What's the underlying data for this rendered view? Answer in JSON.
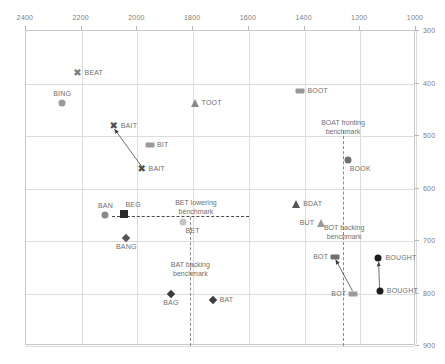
{
  "chart_data": {
    "type": "scatter",
    "title": "",
    "xlabel": "",
    "ylabel": "",
    "xlim": [
      2400,
      1000
    ],
    "ylim": [
      300,
      900
    ],
    "x_axis_position": "top",
    "y_axis_position": "right",
    "x_ticks": [
      2400,
      2200,
      2000,
      1800,
      1600,
      1400,
      1200,
      1000
    ],
    "y_ticks": [
      300,
      400,
      500,
      600,
      700,
      800,
      900
    ],
    "grid": true,
    "legend": "none",
    "points": [
      {
        "label": "BEAT",
        "x": 2215,
        "y": 380,
        "marker": "x",
        "color": "#7a7a7a",
        "label_pos": "right"
      },
      {
        "label": "BING",
        "x": 2270,
        "y": 438,
        "marker": "circle",
        "color": "#9a9a9a",
        "label_pos": "above"
      },
      {
        "label": "BAIT",
        "x": 2085,
        "y": 480,
        "marker": "x",
        "color": "#4d4d4d",
        "label_pos": "right"
      },
      {
        "label": "BAIT",
        "x": 1985,
        "y": 563,
        "marker": "x",
        "color": "#4d4d4d",
        "label_pos": "right"
      },
      {
        "label": "BIT",
        "x": 1955,
        "y": 518,
        "marker": "rect",
        "color": "#9a9a9a",
        "label_pos": "right"
      },
      {
        "label": "TOOT",
        "x": 1795,
        "y": 438,
        "marker": "triangle",
        "color": "#8a8a8a",
        "label_pos": "right"
      },
      {
        "label": "BOOT",
        "x": 1415,
        "y": 415,
        "marker": "rect",
        "color": "#9a9a9a",
        "label_pos": "right"
      },
      {
        "label": "BOOK",
        "x": 1245,
        "y": 545,
        "marker": "circle",
        "color": "#6f6f6f",
        "label_pos": "below-right"
      },
      {
        "label": "BAN",
        "x": 2115,
        "y": 650,
        "marker": "circle",
        "color": "#8a8a8a",
        "label_pos": "above"
      },
      {
        "label": "BEG",
        "x": 2050,
        "y": 648,
        "marker": "square",
        "color": "#2b2b2b",
        "label_pos": "above-right"
      },
      {
        "label": "BANG",
        "x": 2040,
        "y": 695,
        "marker": "diamond",
        "color": "#555555",
        "label_pos": "below"
      },
      {
        "label": "BET",
        "x": 1835,
        "y": 663,
        "marker": "circle",
        "color": "#c4c4c4",
        "label_pos": "below-right"
      },
      {
        "label": "BDAT",
        "x": 1430,
        "y": 630,
        "marker": "triangle",
        "color": "#555555",
        "label_pos": "right"
      },
      {
        "label": "BUT",
        "x": 1340,
        "y": 665,
        "marker": "triangle",
        "color": "#9a9a9a",
        "label_pos": "left"
      },
      {
        "label": "BOT",
        "x": 1290,
        "y": 730,
        "marker": "rect",
        "color": "#6f6f6f",
        "label_pos": "left"
      },
      {
        "label": "BOT",
        "x": 1225,
        "y": 800,
        "marker": "rect",
        "color": "#9a9a9a",
        "label_pos": "left"
      },
      {
        "label": "BOUGHT",
        "x": 1135,
        "y": 733,
        "marker": "circle",
        "color": "#1c1c1c",
        "label_pos": "right"
      },
      {
        "label": "BOUGHT",
        "x": 1130,
        "y": 795,
        "marker": "circle",
        "color": "#1c1c1c",
        "label_pos": "right"
      },
      {
        "label": "BAG",
        "x": 1880,
        "y": 800,
        "marker": "diamond",
        "color": "#3d3d3d",
        "label_pos": "below"
      },
      {
        "label": "BAT",
        "x": 1730,
        "y": 812,
        "marker": "diamond",
        "color": "#3d3d3d",
        "label_pos": "right"
      }
    ],
    "arrows": [
      {
        "name": "bait-transition",
        "from_x": 1985,
        "from_y": 558,
        "to_x": 2082,
        "to_y": 487
      },
      {
        "name": "bot-transition",
        "from_x": 1228,
        "from_y": 795,
        "to_x": 1288,
        "to_y": 736
      },
      {
        "name": "bought-transition",
        "from_x": 1131,
        "from_y": 790,
        "to_x": 1134,
        "to_y": 740
      }
    ],
    "annotations": [
      {
        "name": "boat-fronting-benchmark",
        "text_line1": "BOAT fronting",
        "text_line2": "benchmark",
        "orientation": "vertical",
        "x": 1262,
        "y_top": 490,
        "y_bottom": 900,
        "label_y": 500
      },
      {
        "name": "bet-lowering-benchmark",
        "text_line1": "BET lowering",
        "text_line2": "benchmark",
        "orientation": "horizontal",
        "y": 652,
        "x_left": 2090,
        "x_right": 1600,
        "label_x": 1790
      },
      {
        "name": "bat-backing-benchmark",
        "text_line1": "BAT backing",
        "text_line2": "benchmark",
        "orientation": "vertical",
        "x": 1810,
        "y_top": 655,
        "y_bottom": 900,
        "label_y": 770
      },
      {
        "name": "bot-backing-benchmark",
        "text_line1": "BOT backing",
        "text_line2": "benchmark",
        "orientation": "none",
        "label_x": 1258,
        "label_y": 700
      }
    ]
  }
}
